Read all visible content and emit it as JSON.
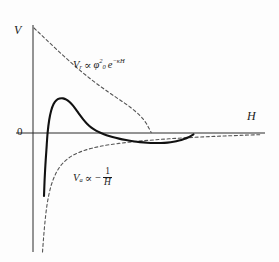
{
  "figure": {
    "background_color": "#fdfdfd",
    "line_color": "#1a1a1a"
  },
  "axes": {
    "y_label": "V",
    "x_label": "H",
    "origin_label": "0"
  },
  "labels": {
    "repulsive": {
      "var": "V",
      "var_sub": "r",
      "relation": "∝",
      "phi": "φ",
      "phi_sub": "0",
      "phi_sup": "2",
      "base": "e",
      "exponent": "−κH",
      "full_text": "Vᵣ ∝ φ₀² e⁻ᵏᴴ"
    },
    "attractive": {
      "var": "V",
      "var_sub": "a",
      "relation": "∝",
      "minus": "−",
      "numerator": "1",
      "denominator": "H",
      "full_text": "Vₐ ∝ − 1/H"
    }
  },
  "chart_data": {
    "type": "line",
    "xlabel": "H",
    "ylabel": "V",
    "grid": false,
    "legend": "inline-annotations",
    "xlim": [
      0,
      1
    ],
    "ylim": [
      -1,
      1
    ],
    "axis_pixels": {
      "x_axis_y": 133,
      "y_axis_x": 33,
      "x_axis_left": 16,
      "x_axis_right": 265,
      "y_axis_top": 25,
      "y_axis_bottom": 252
    },
    "series": [
      {
        "name": "total-potential",
        "style": "solid",
        "color": "#111111",
        "width": 2.1,
        "description": "Net DLVO curve: deep primary minimum at small H, steep rise through zero, primary maximum, decay through zero into shallow secondary minimum, then approach to zero.",
        "points_px": [
          [
            44.0,
            196.0
          ],
          [
            44.6,
            180.0
          ],
          [
            45.4,
            165.0
          ],
          [
            46.4,
            150.0
          ],
          [
            47.6,
            133.0
          ],
          [
            49.2,
            120.0
          ],
          [
            51.2,
            110.5
          ],
          [
            53.6,
            104.0
          ],
          [
            56.4,
            100.2
          ],
          [
            59.6,
            98.6
          ],
          [
            63.0,
            98.4
          ],
          [
            66.4,
            99.6
          ],
          [
            69.6,
            102.0
          ],
          [
            72.8,
            105.4
          ],
          [
            76.0,
            109.6
          ],
          [
            79.4,
            114.4
          ],
          [
            83.0,
            119.2
          ],
          [
            87.0,
            123.8
          ],
          [
            91.4,
            127.6
          ],
          [
            96.0,
            130.6
          ],
          [
            101.0,
            133.0
          ],
          [
            106.5,
            135.2
          ],
          [
            112.5,
            137.0
          ],
          [
            119.0,
            138.6
          ],
          [
            126.0,
            140.0
          ],
          [
            133.0,
            141.2
          ],
          [
            140.0,
            142.1
          ],
          [
            147.0,
            142.7
          ],
          [
            154.0,
            143.0
          ],
          [
            161.0,
            143.0
          ],
          [
            167.5,
            142.6
          ],
          [
            173.5,
            141.8
          ],
          [
            179.0,
            140.6
          ],
          [
            184.0,
            139.0
          ],
          [
            188.5,
            137.2
          ],
          [
            191.5,
            135.6
          ],
          [
            193.5,
            134.4
          ]
        ]
      },
      {
        "name": "repulsive-exponential",
        "style": "dashed",
        "color": "#555555",
        "width": 1.1,
        "description": "Electrostatic double-layer repulsion, decaying exponentially from the V axis toward zero.",
        "points_px": [
          [
            34.0,
            28.0
          ],
          [
            38.0,
            31.8
          ],
          [
            42.0,
            35.6
          ],
          [
            46.0,
            39.4
          ],
          [
            50.0,
            43.2
          ],
          [
            55.0,
            47.9
          ],
          [
            60.0,
            52.6
          ],
          [
            65.0,
            57.2
          ],
          [
            70.0,
            61.7
          ],
          [
            75.0,
            66.1
          ],
          [
            80.0,
            70.4
          ],
          [
            85.0,
            74.5
          ],
          [
            90.0,
            78.5
          ],
          [
            95.0,
            82.4
          ],
          [
            100.0,
            86.1
          ],
          [
            105.0,
            89.7
          ],
          [
            110.0,
            93.2
          ],
          [
            115.0,
            96.6
          ],
          [
            120.0,
            100.0
          ],
          [
            125.0,
            103.4
          ],
          [
            130.0,
            107.0
          ],
          [
            135.0,
            111.0
          ],
          [
            140.0,
            115.6
          ],
          [
            143.0,
            118.9
          ],
          [
            146.0,
            123.0
          ],
          [
            148.0,
            126.4
          ],
          [
            150.0,
            130.2
          ],
          [
            151.2,
            132.6
          ]
        ]
      },
      {
        "name": "attractive-van-der-waals",
        "style": "dashed",
        "color": "#555555",
        "width": 1.1,
        "description": "van der Waals attraction proportional to minus one over H, diverging near the origin and approaching zero from below at large H.",
        "points_px": [
          [
            42.5,
            252.0
          ],
          [
            43.4,
            240.0
          ],
          [
            44.4,
            228.0
          ],
          [
            45.6,
            216.0
          ],
          [
            47.0,
            205.0
          ],
          [
            48.8,
            195.0
          ],
          [
            51.0,
            186.0
          ],
          [
            53.6,
            178.5
          ],
          [
            56.6,
            172.0
          ],
          [
            60.0,
            166.6
          ],
          [
            64.0,
            162.0
          ],
          [
            68.5,
            158.2
          ],
          [
            73.5,
            155.0
          ],
          [
            79.0,
            152.4
          ],
          [
            85.0,
            150.2
          ],
          [
            92.0,
            148.2
          ],
          [
            100.0,
            146.4
          ],
          [
            109.0,
            144.8
          ],
          [
            119.0,
            143.4
          ],
          [
            130.0,
            142.1
          ],
          [
            142.0,
            140.9
          ],
          [
            155.0,
            139.8
          ],
          [
            169.0,
            138.8
          ],
          [
            184.0,
            137.9
          ],
          [
            199.0,
            137.1
          ],
          [
            214.0,
            136.4
          ],
          [
            229.0,
            135.8
          ],
          [
            244.0,
            135.2
          ],
          [
            256.0,
            134.8
          ],
          [
            262.0,
            134.6
          ]
        ]
      }
    ]
  }
}
